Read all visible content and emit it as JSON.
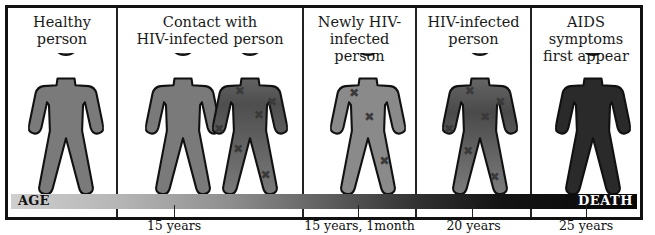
{
  "panels": [
    {
      "title_line1": "Healthy",
      "title_line2": "person"
    },
    {
      "title_line1": "Contact with",
      "title_line2": "HIV-infected person"
    },
    {
      "title_line1": "Newly HIV-",
      "title_line2": "infected person"
    },
    {
      "title_line1": "HIV-infected",
      "title_line2": "person"
    },
    {
      "title_line1": "AIDS symptoms",
      "title_line2": "first appear"
    }
  ],
  "figures": [
    {
      "name": "healthy-person-figure",
      "state": "healthy",
      "fill": "#7a7a7a"
    },
    {
      "name": "contact-person-figure",
      "state": "healthy",
      "fill": "#7a7a7a"
    },
    {
      "name": "infected-contact-figure",
      "state": "infected",
      "fill": "#5e5e5e",
      "marks": 6
    },
    {
      "name": "newly-infected-figure",
      "state": "newly-infected",
      "fill": "#8a8a8a",
      "marks": 3
    },
    {
      "name": "hiv-infected-figure",
      "state": "infected",
      "fill": "#5a5a5a",
      "marks": 6
    },
    {
      "name": "aids-figure",
      "state": "aids",
      "fill": "#2a2a2a"
    }
  ],
  "timeline": {
    "start_label": "AGE",
    "end_label": "DEATH",
    "markers": [
      {
        "label": "15 years"
      },
      {
        "label": "15 years, 1month"
      },
      {
        "label": "20 years"
      },
      {
        "label": "25 years"
      }
    ]
  },
  "colors": {
    "border": "#111111",
    "healthy_fill": "#7a7a7a",
    "aids_fill": "#2a2a2a",
    "bar_start": "#cfcfcf",
    "bar_end": "#080808"
  }
}
